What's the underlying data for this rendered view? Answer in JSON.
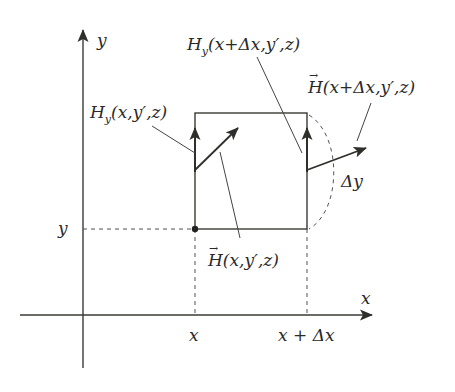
{
  "diagram": {
    "colors": {
      "line": "#3a3a34",
      "text": "#2a2a2a",
      "background": "#ffffff"
    },
    "axes": {
      "x_label": "x",
      "y_label": "y"
    },
    "ticks": {
      "y_tick": "y",
      "x_tick_left": "x",
      "x_tick_right": "x + Δx"
    },
    "labels": {
      "hy_left": "H",
      "hy_left_sub": "y",
      "hy_left_args": "(x,y′,z)",
      "hy_right": "H",
      "hy_right_sub": "y",
      "hy_right_args": "(x+Δx,y′,z)",
      "hvec_left": "H",
      "hvec_left_args": "(x,y′,z)",
      "hvec_right": "H",
      "hvec_right_args": "(x+Δx,y′,z)",
      "delta_y": "Δy",
      "vector_arrow": "→"
    }
  }
}
